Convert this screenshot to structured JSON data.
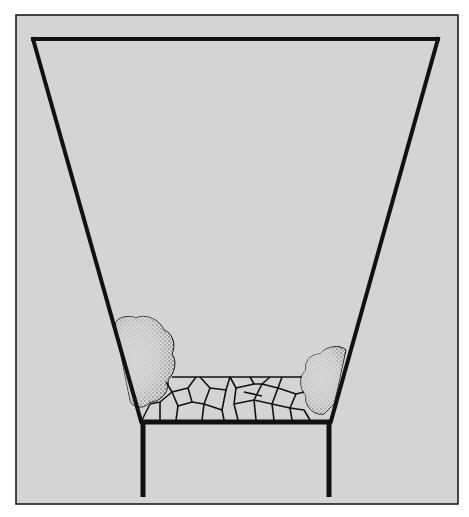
{
  "diagram": {
    "colors": {
      "page_background": "#ffffff",
      "panel_fill": "#d4d4d4",
      "line": "#111111",
      "stipple": "#1a1a1a"
    },
    "elements": [
      {
        "id": "outer-frame",
        "label": "Frame"
      },
      {
        "id": "trapezoid-pit",
        "label": "Tapered pit outline"
      },
      {
        "id": "shrub-left",
        "label": "Left shrub"
      },
      {
        "id": "shrub-right",
        "label": "Right shrub"
      },
      {
        "id": "paving",
        "label": "Crazy paving stones"
      },
      {
        "id": "base-bar",
        "label": "Base slab"
      },
      {
        "id": "support-legs",
        "label": "Vertical supports"
      }
    ]
  }
}
